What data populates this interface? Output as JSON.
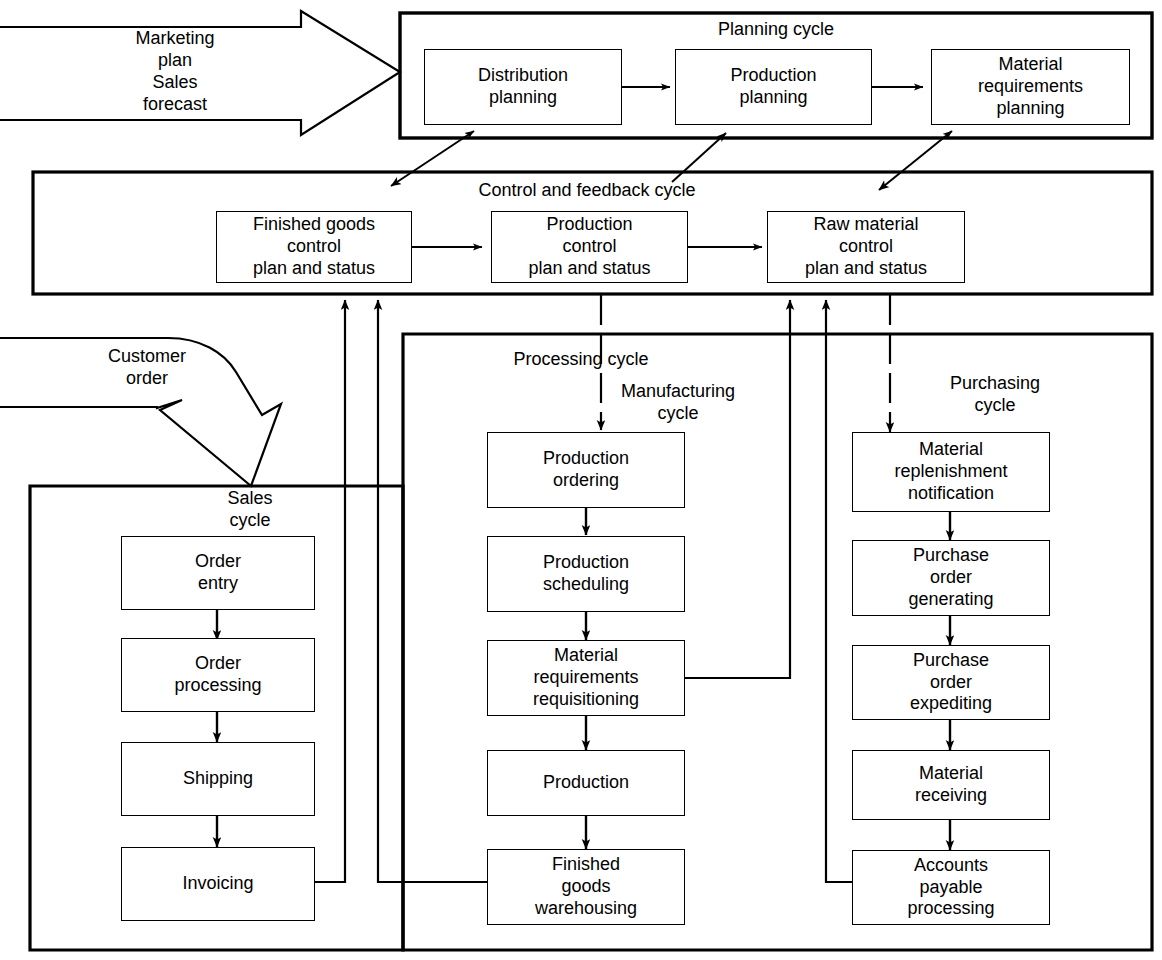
{
  "diagram": {
    "stroke_color": "#000000",
    "background_color": "#ffffff"
  },
  "inputs": [
    {
      "id": "marketing-input",
      "text": "Marketing\nplan\nSales\nforecast"
    },
    {
      "id": "customer-input",
      "text": "Customer\norder"
    }
  ],
  "cycles": [
    {
      "id": "planning-cycle",
      "label": "Planning cycle"
    },
    {
      "id": "control-cycle",
      "label": "Control and feedback cycle"
    },
    {
      "id": "processing-cycle",
      "label": "Processing cycle"
    },
    {
      "id": "manufacturing-cycle",
      "label": "Manufacturing\ncycle"
    },
    {
      "id": "purchasing-cycle",
      "label": "Purchasing\ncycle"
    },
    {
      "id": "sales-cycle",
      "label": "Sales\ncycle"
    }
  ],
  "planning": {
    "label": "Planning cycle",
    "nodes": [
      {
        "id": "distribution-planning",
        "text": "Distribution\nplanning"
      },
      {
        "id": "production-planning",
        "text": "Production\nplanning"
      },
      {
        "id": "material-requirements-planning",
        "text": "Material\nrequirements\nplanning"
      }
    ]
  },
  "control": {
    "label": "Control and feedback cycle",
    "nodes": [
      {
        "id": "finished-goods-control",
        "text": "Finished goods\ncontrol\nplan and status"
      },
      {
        "id": "production-control",
        "text": "Production\ncontrol\nplan and status"
      },
      {
        "id": "raw-material-control",
        "text": "Raw material\ncontrol\nplan and status"
      }
    ]
  },
  "sales": {
    "label": "Sales\ncycle",
    "nodes": [
      {
        "id": "order-entry",
        "text": "Order\nentry"
      },
      {
        "id": "order-processing",
        "text": "Order\nprocessing"
      },
      {
        "id": "shipping",
        "text": "Shipping"
      },
      {
        "id": "invoicing",
        "text": "Invoicing"
      }
    ]
  },
  "manufacturing": {
    "label": "Manufacturing\ncycle",
    "nodes": [
      {
        "id": "production-ordering",
        "text": "Production\nordering"
      },
      {
        "id": "production-scheduling",
        "text": "Production\nscheduling"
      },
      {
        "id": "material-requirements-requisitioning",
        "text": "Material\nrequirements\nrequisitioning"
      },
      {
        "id": "production",
        "text": "Production"
      },
      {
        "id": "finished-goods-warehousing",
        "text": "Finished\ngoods\nwarehousing"
      }
    ]
  },
  "purchasing": {
    "label": "Purchasing\ncycle",
    "nodes": [
      {
        "id": "material-replenishment-notification",
        "text": "Material\nreplenishment\nnotification"
      },
      {
        "id": "purchase-order-generating",
        "text": "Purchase\norder\ngenerating"
      },
      {
        "id": "purchase-order-expediting",
        "text": "Purchase\norder\nexpediting"
      },
      {
        "id": "material-receiving",
        "text": "Material\nreceiving"
      },
      {
        "id": "accounts-payable-processing",
        "text": "Accounts\npayable\nprocessing"
      }
    ]
  }
}
